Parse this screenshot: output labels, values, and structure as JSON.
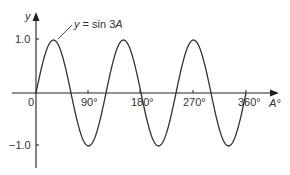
{
  "chart_data": {
    "type": "line",
    "title": "",
    "xlabel": "A°",
    "ylabel": "y",
    "series": [
      {
        "name": "y = sin 3A",
        "function": "sin(3A)",
        "x_range_deg": [
          0,
          360
        ]
      }
    ],
    "x_ticks": [
      {
        "value": 0,
        "label": "0"
      },
      {
        "value": 90,
        "label": "90°"
      },
      {
        "value": 180,
        "label": "180°"
      },
      {
        "value": 270,
        "label": "270°"
      },
      {
        "value": 360,
        "label": "360°"
      }
    ],
    "y_ticks": [
      {
        "value": 1.0,
        "label": "1.0"
      },
      {
        "value": -1.0,
        "label": "−1.0"
      }
    ],
    "xlim": [
      0,
      360
    ],
    "ylim": [
      -1.2,
      1.4
    ],
    "grid": false,
    "legend": "none",
    "annotations": [
      {
        "text": "y = sin 3A",
        "points_to": "first peak at A = 30°"
      }
    ],
    "sample_points": [
      {
        "x": 0,
        "y": 0
      },
      {
        "x": 30,
        "y": 1
      },
      {
        "x": 60,
        "y": 0
      },
      {
        "x": 90,
        "y": -1
      },
      {
        "x": 120,
        "y": 0
      },
      {
        "x": 150,
        "y": 1
      },
      {
        "x": 180,
        "y": 0
      },
      {
        "x": 210,
        "y": -1
      },
      {
        "x": 240,
        "y": 0
      },
      {
        "x": 270,
        "y": 1
      },
      {
        "x": 300,
        "y": 0
      },
      {
        "x": 330,
        "y": -1
      },
      {
        "x": 360,
        "y": 0
      }
    ]
  },
  "labels": {
    "y_axis": "y",
    "x_axis": "A°",
    "origin": "0",
    "tick_90": "90°",
    "tick_180": "180°",
    "tick_270": "270°",
    "tick_360": "360°",
    "y_pos": "1.0",
    "y_neg": "−1.0",
    "curve_label": "y = sin 3A"
  },
  "colors": {
    "axis": "#222222",
    "curve": "#333333",
    "text": "#333333"
  }
}
